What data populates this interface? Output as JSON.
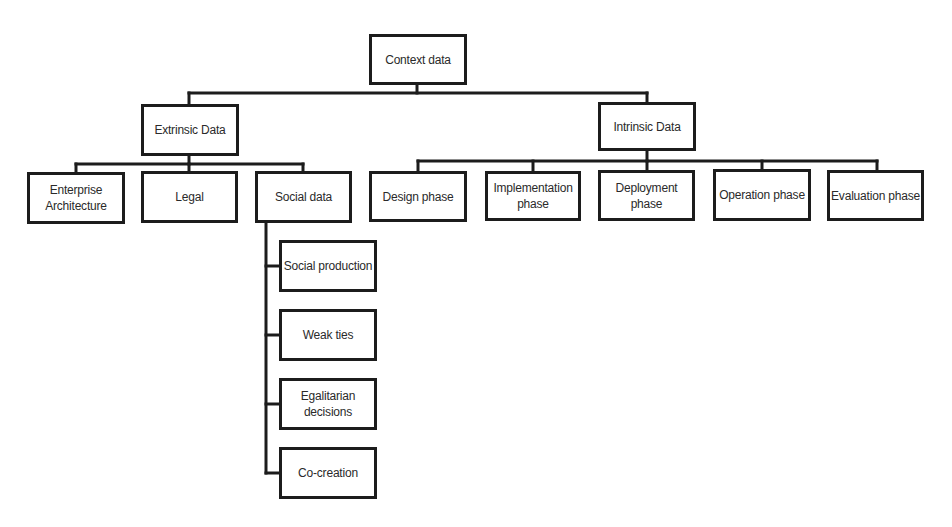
{
  "diagram": {
    "type": "hierarchy-tree",
    "root": {
      "id": "context",
      "label": "Context data",
      "children": [
        "extrinsic",
        "intrinsic"
      ]
    },
    "nodes": {
      "context": {
        "label": "Context data"
      },
      "extrinsic": {
        "label": "Extrinsic Data"
      },
      "intrinsic": {
        "label": "Intrinsic Data"
      },
      "enterprise": {
        "label": "Enterprise\nArchitecture"
      },
      "legal": {
        "label": "Legal"
      },
      "social": {
        "label": "Social data"
      },
      "social_production": {
        "label": "Social production"
      },
      "weak_ties": {
        "label": "Weak ties"
      },
      "egalitarian": {
        "label": "Egalitarian\ndecisions"
      },
      "cocreation": {
        "label": "Co-creation"
      },
      "design": {
        "label": "Design phase"
      },
      "implementation": {
        "label": "Implementation\nphase"
      },
      "deployment": {
        "label": "Deployment\nphase"
      },
      "operation": {
        "label": "Operation phase"
      },
      "evaluation": {
        "label": "Evaluation phase"
      }
    },
    "edges": [
      [
        "context",
        "extrinsic"
      ],
      [
        "context",
        "intrinsic"
      ],
      [
        "extrinsic",
        "enterprise"
      ],
      [
        "extrinsic",
        "legal"
      ],
      [
        "extrinsic",
        "social"
      ],
      [
        "social",
        "social_production"
      ],
      [
        "social",
        "weak_ties"
      ],
      [
        "social",
        "egalitarian"
      ],
      [
        "social",
        "cocreation"
      ],
      [
        "intrinsic",
        "design"
      ],
      [
        "intrinsic",
        "implementation"
      ],
      [
        "intrinsic",
        "deployment"
      ],
      [
        "intrinsic",
        "operation"
      ],
      [
        "intrinsic",
        "evaluation"
      ]
    ],
    "colors": {
      "line": "#1c1c1c",
      "box_border": "#1c1c1c",
      "text": "#2a2a2a",
      "background": "#ffffff"
    }
  }
}
